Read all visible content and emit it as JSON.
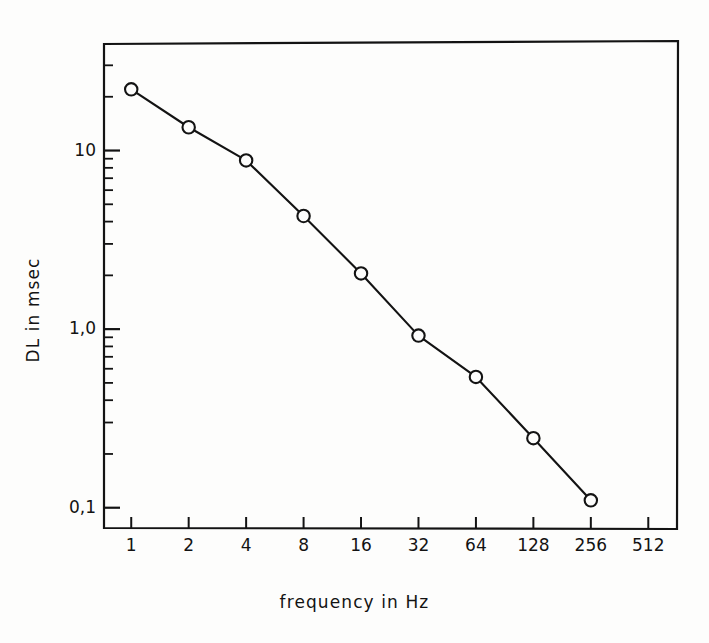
{
  "figure": {
    "background_color": "#fdfdfc",
    "ink_color": "#131313"
  },
  "axes": {
    "x_title": "frequency  in  Hz",
    "y_title": "DL  in  msec"
  },
  "chart_data": {
    "type": "line",
    "title": "",
    "xlabel": "frequency  in  Hz",
    "ylabel": "DL  in  msec",
    "x_scale": "log",
    "y_scale": "log",
    "xlim": [
      0.72,
      724
    ],
    "ylim": [
      0.077,
      40
    ],
    "grid": false,
    "legend": null,
    "marker": "open-circle",
    "line_style": "solid",
    "x_tick_labels": [
      "1",
      "2",
      "4",
      "8",
      "16",
      "32",
      "64",
      "128",
      "256",
      "512"
    ],
    "x_ticks": [
      1,
      2,
      4,
      8,
      16,
      32,
      64,
      128,
      256,
      512
    ],
    "y_tick_labels": [
      "10",
      "1,0",
      "0,1"
    ],
    "y_ticks": [
      10,
      1.0,
      0.1
    ],
    "y_minor_ticks": [
      0.1,
      0.2,
      0.3,
      0.4,
      0.5,
      0.6,
      0.7,
      0.8,
      0.9,
      1,
      2,
      3,
      4,
      5,
      6,
      7,
      8,
      9,
      10,
      20,
      30
    ],
    "x": [
      1,
      2,
      4,
      8,
      16,
      32,
      64,
      128,
      256
    ],
    "values": [
      22,
      13.5,
      8.8,
      4.3,
      2.05,
      0.92,
      0.54,
      0.245,
      0.11
    ],
    "points": [
      {
        "x": 1,
        "y": 22
      },
      {
        "x": 2,
        "y": 13.5
      },
      {
        "x": 4,
        "y": 8.8
      },
      {
        "x": 8,
        "y": 4.3
      },
      {
        "x": 16,
        "y": 2.05
      },
      {
        "x": 32,
        "y": 0.92
      },
      {
        "x": 64,
        "y": 0.54
      },
      {
        "x": 128,
        "y": 0.245
      },
      {
        "x": 256,
        "y": 0.11
      }
    ]
  }
}
